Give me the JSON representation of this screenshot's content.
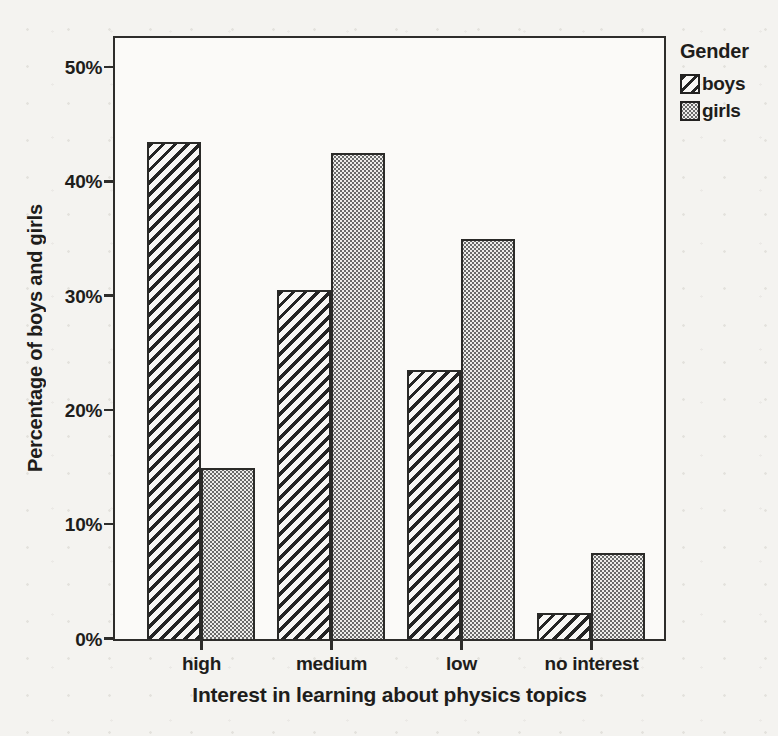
{
  "chart_data": {
    "type": "bar",
    "title": "",
    "xlabel": "Interest in learning about physics topics",
    "ylabel": "Percentage of boys and girls",
    "legend_title": "Gender",
    "legend_position": "top-right-outside",
    "categories": [
      "high",
      "medium",
      "low",
      "no interest"
    ],
    "series": [
      {
        "name": "boys",
        "pattern": "diagonal-hatch",
        "values": [
          43.5,
          30.5,
          23.5,
          2.3
        ]
      },
      {
        "name": "girls",
        "pattern": "dot-grid",
        "values": [
          15.0,
          42.5,
          35.0,
          7.5
        ]
      }
    ],
    "ytick_labels": [
      "0%",
      "10%",
      "20%",
      "30%",
      "40%",
      "50%"
    ],
    "ytick_values": [
      0,
      10,
      20,
      30,
      40,
      50
    ],
    "ylim": [
      0,
      52.5
    ],
    "grid": false
  },
  "colors": {
    "ink": "#1e1d1b",
    "axis": "#2e2d2b",
    "plot_background": "#fbfaf8",
    "page_background": "#f4f3f0",
    "girls_fill": "#eeedeb",
    "boys_fill": "#f8f7f5"
  }
}
